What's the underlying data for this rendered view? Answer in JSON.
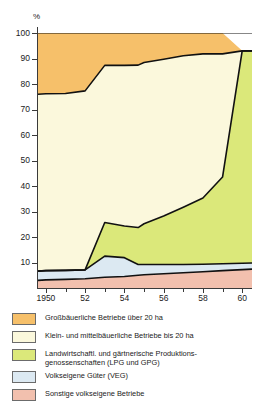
{
  "chart_data": {
    "type": "area",
    "stacked": true,
    "title": "",
    "xlabel": "",
    "ylabel": "%",
    "ylim": [
      0,
      100
    ],
    "yticks": [
      10,
      20,
      30,
      40,
      50,
      60,
      70,
      80,
      90,
      100
    ],
    "ytick_labels": [
      "10",
      "20",
      "30",
      "40",
      "50",
      "60",
      "70",
      "80",
      "90",
      "100"
    ],
    "xlim": [
      1949.5,
      1960.6
    ],
    "xticks": [
      1950,
      1951,
      1952,
      1953,
      1954,
      1955,
      1956,
      1957,
      1958,
      1959,
      1960
    ],
    "xtick_labels": [
      "1950",
      "",
      "52",
      "",
      "54",
      "",
      "56",
      "",
      "58",
      "",
      "60"
    ],
    "grid": false,
    "legend_position": "below",
    "x": [
      1949.6,
      1950,
      1951,
      1952,
      1953,
      1954,
      1954.7,
      1955,
      1956,
      1957,
      1958,
      1959,
      1960,
      1960.5
    ],
    "series": [
      {
        "name": "Sonstige volkseigene Betriebe",
        "color": "#F2C0AE",
        "values": [
          3.0,
          3.2,
          3.4,
          3.6,
          4.2,
          4.5,
          5.0,
          5.2,
          5.6,
          6.0,
          6.4,
          6.8,
          7.2,
          7.4
        ]
      },
      {
        "name": "Volkseigene Güter (VEG)",
        "color": "#DCE9F2",
        "values": [
          3.6,
          3.6,
          3.5,
          3.5,
          8.3,
          7.4,
          4.2,
          4.0,
          3.6,
          3.2,
          2.9,
          2.7,
          2.5,
          2.4
        ]
      },
      {
        "name": "Landwirtschaftl. und gärtnerische Produktionsgenossenschaften (LPG und GPG)",
        "color": "#DBE87A",
        "values": [
          0.0,
          0.0,
          0.0,
          0.0,
          13.2,
          12.4,
          14.5,
          16.0,
          19.0,
          22.5,
          26.0,
          34.0,
          83.3,
          83.2
        ]
      },
      {
        "name": "Klein- und mittelbäuerliche Betriebe bis 20 ha",
        "color": "#FBF8DC",
        "values": [
          69.4,
          69.4,
          69.4,
          70.2,
          61.6,
          63.0,
          63.7,
          63.2,
          61.5,
          59.4,
          56.5,
          48.3,
          0.0,
          0.0
        ]
      },
      {
        "name": "Großbäuerliche Betriebe über 20 ha",
        "color": "#F6C06A",
        "values": [
          24.0,
          23.8,
          23.7,
          22.7,
          12.7,
          12.7,
          12.6,
          11.6,
          10.3,
          8.9,
          8.2,
          8.2,
          0.0,
          0.0
        ]
      }
    ],
    "cumulative_tops": {
      "note": "stacked upper boundaries in percent, bottom-to-top order",
      "band1_top": [
        3.0,
        3.2,
        3.4,
        3.6,
        4.2,
        4.5,
        5.0,
        5.2,
        5.6,
        6.0,
        6.4,
        6.8,
        7.2,
        7.4
      ],
      "band2_top": [
        6.6,
        6.8,
        6.9,
        7.1,
        12.5,
        11.9,
        9.2,
        9.2,
        9.2,
        9.2,
        9.3,
        9.5,
        9.7,
        9.8
      ],
      "band3_top": [
        6.6,
        6.8,
        6.9,
        7.1,
        25.7,
        24.3,
        23.7,
        25.2,
        28.2,
        31.7,
        35.3,
        43.5,
        93.0,
        93.0
      ],
      "band4_top": [
        76.0,
        76.2,
        76.3,
        77.3,
        87.3,
        87.3,
        87.4,
        88.4,
        89.7,
        91.1,
        91.8,
        91.8,
        100.0,
        100.0
      ],
      "band5_top": [
        100,
        100,
        100,
        100,
        100,
        100,
        100,
        100,
        100,
        100,
        100,
        100,
        100,
        100
      ]
    }
  },
  "axis": {
    "unit_label": "%"
  },
  "legend": {
    "items": [
      {
        "color": "#F6C06A",
        "line1": "Großbäuerliche Betriebe über 20 ha",
        "line2": ""
      },
      {
        "color": "#FBF8DC",
        "line1": "Klein- und mittelbäuerliche Betriebe bis 20 ha",
        "line2": ""
      },
      {
        "color": "#DBE87A",
        "line1": "Landwirtschaftl. und gärtnerische Produktions-",
        "line2": "genossenschaften (LPG und GPG)"
      },
      {
        "color": "#DCE9F2",
        "line1": "Volkseigene Güter (VEG)",
        "line2": ""
      },
      {
        "color": "#F2C0AE",
        "line1": "Sonstige volkseigene Betriebe",
        "line2": ""
      }
    ]
  }
}
